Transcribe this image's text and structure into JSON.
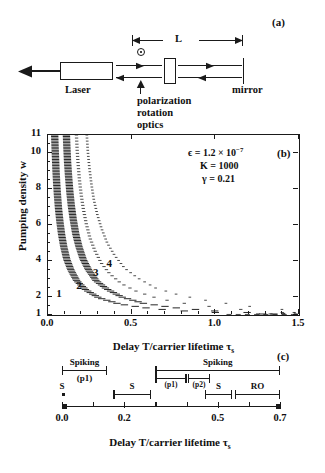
{
  "figure": {
    "panel_a": {
      "tag": "(a)",
      "cavity_length_label": "L",
      "laser_label": "Laser",
      "polarization_label_line1": "polarization",
      "polarization_label_line2": "rotation",
      "polarization_label_line3": "optics",
      "mirror_label": "mirror",
      "polarization_symbol": "circle-dot",
      "output_arrow": "left-arrow"
    },
    "panel_b": {
      "tag": "(b)",
      "params": {
        "epsilon_label": "ϵ = 1.2 × 10",
        "epsilon_exp": "−7",
        "K_label": "K = 1000",
        "gamma_label": "γ = 0.21"
      },
      "curve_labels": [
        "1",
        "2",
        "3",
        "4"
      ]
    },
    "panel_c": {
      "tag": "(c)",
      "brackets": [
        {
          "name": "spiking-p1",
          "label_top": "Spiking",
          "label_bottom": "(p1)",
          "x0": 0.0,
          "x1": 0.145
        },
        {
          "name": "spiking-p1-p2",
          "label_top": "Spiking",
          "label_bottom": "",
          "x0": 0.3,
          "x1": 0.7
        },
        {
          "name": "p1-sub",
          "label_top": "",
          "label_bottom": "(p1)",
          "x0": 0.3,
          "x1": 0.4
        },
        {
          "name": "p2-sub",
          "label_top": "",
          "label_bottom": "(p2)",
          "x0": 0.405,
          "x1": 0.475
        },
        {
          "name": "s-left",
          "label_top": "S",
          "label_bottom": "",
          "x0": 0.0,
          "x1": 0.0
        },
        {
          "name": "s-mid",
          "label_top": "S",
          "label_bottom": "",
          "x0": 0.165,
          "x1": 0.285
        },
        {
          "name": "s-right",
          "label_top": "S",
          "label_bottom": "",
          "x0": 0.46,
          "x1": 0.545
        },
        {
          "name": "ro",
          "label_top": "RO",
          "label_bottom": "",
          "x0": 0.555,
          "x1": 0.7
        }
      ]
    },
    "shared": {
      "xlabel": "Delay T/carrier lifetime τ",
      "xlabel_sub": "s",
      "ylabel_b": "Pumping density w"
    }
  },
  "chart_data": [
    {
      "id": "panel-b",
      "type": "line",
      "title": "",
      "xlabel": "Delay T/carrier lifetime τs",
      "ylabel": "Pumping density w",
      "xlim": [
        0.0,
        1.5
      ],
      "ylim": [
        1,
        11
      ],
      "xticks": [
        0.0,
        0.5,
        1.0,
        1.5
      ],
      "xticklabels": [
        "0.0",
        "0.5",
        "1.0",
        "1.5"
      ],
      "yticks": [
        1,
        2,
        4,
        6,
        8,
        10,
        11
      ],
      "yticklabels": [
        "1",
        "2",
        "4",
        "6",
        "8",
        "10",
        "11"
      ],
      "grid": false,
      "legend": "none",
      "annotations": [
        {
          "text": "ϵ = 1.2 × 10−7",
          "x": 0.78,
          "y": 10.3
        },
        {
          "text": "K = 1000",
          "x": 0.8,
          "y": 9.3
        },
        {
          "text": "γ = 0.21",
          "x": 0.8,
          "y": 8.4
        },
        {
          "text": "(b)",
          "x": 1.37,
          "y": 10.3
        }
      ],
      "series": [
        {
          "name": "1",
          "label_pos": {
            "x": 0.055,
            "y": 2.1
          },
          "style": "dense-dashed-band",
          "band_halfwidth": 0.022,
          "x": [
            0.04,
            0.042,
            0.045,
            0.048,
            0.052,
            0.057,
            0.063,
            0.071,
            0.081,
            0.094,
            0.112,
            0.137,
            0.172,
            0.225,
            0.305,
            0.43,
            0.62,
            0.9,
            1.3
          ],
          "y": [
            11.0,
            10.4,
            9.7,
            9.0,
            8.3,
            7.6,
            6.9,
            6.2,
            5.5,
            4.8,
            4.1,
            3.5,
            2.9,
            2.4,
            1.95,
            1.6,
            1.35,
            1.17,
            1.05
          ]
        },
        {
          "name": "2",
          "label_pos": {
            "x": 0.175,
            "y": 2.55
          },
          "style": "dense-dashed-band",
          "band_halfwidth": 0.022,
          "x": [
            0.11,
            0.113,
            0.117,
            0.123,
            0.13,
            0.139,
            0.151,
            0.166,
            0.185,
            0.21,
            0.243,
            0.288,
            0.35,
            0.44,
            0.57,
            0.76,
            1.03,
            1.35
          ],
          "y": [
            11.0,
            10.3,
            9.5,
            8.7,
            7.9,
            7.1,
            6.3,
            5.5,
            4.8,
            4.1,
            3.5,
            2.9,
            2.45,
            2.0,
            1.65,
            1.4,
            1.2,
            1.08
          ]
        },
        {
          "name": "3",
          "label_pos": {
            "x": 0.275,
            "y": 3.3
          },
          "style": "dotted",
          "band_halfwidth": 0.01,
          "x": [
            0.17,
            0.174,
            0.18,
            0.188,
            0.198,
            0.211,
            0.228,
            0.25,
            0.279,
            0.317,
            0.368,
            0.437,
            0.532,
            0.663,
            0.845,
            1.09,
            1.4
          ],
          "y": [
            11.0,
            10.2,
            9.4,
            8.5,
            7.7,
            6.9,
            6.1,
            5.3,
            4.6,
            3.9,
            3.3,
            2.75,
            2.3,
            1.9,
            1.6,
            1.35,
            1.15
          ]
        },
        {
          "name": "4",
          "label_pos": {
            "x": 0.355,
            "y": 3.8
          },
          "style": "dotted-sparse",
          "band_halfwidth": 0.008,
          "x": [
            0.232,
            0.238,
            0.247,
            0.259,
            0.274,
            0.294,
            0.32,
            0.354,
            0.399,
            0.458,
            0.537,
            0.643,
            0.787,
            0.98,
            1.23,
            1.47
          ],
          "y": [
            11.0,
            10.1,
            9.2,
            8.3,
            7.4,
            6.6,
            5.8,
            5.0,
            4.3,
            3.6,
            3.05,
            2.5,
            2.1,
            1.75,
            1.45,
            1.25
          ]
        }
      ]
    },
    {
      "id": "panel-c",
      "type": "annotation-axis",
      "xlabel": "Delay T/carrier lifetime τs",
      "xlim": [
        0.0,
        0.7
      ],
      "xticks": [
        0.0,
        0.1,
        0.2,
        0.3,
        0.4,
        0.5,
        0.6,
        0.7
      ],
      "xticklabels": [
        "0.0",
        "",
        "0.2",
        "",
        "",
        "0.5",
        "",
        "0.7"
      ],
      "regions": [
        {
          "label": "Spiking (p1)",
          "start": 0.0,
          "end": 0.145,
          "row": 0
        },
        {
          "label": "Spiking",
          "start": 0.3,
          "end": 0.7,
          "row": 0
        },
        {
          "label": "(p1)",
          "start": 0.3,
          "end": 0.4,
          "row": 1
        },
        {
          "label": "(p2)",
          "start": 0.405,
          "end": 0.475,
          "row": 1
        },
        {
          "label": "S",
          "start": 0.0,
          "end": 0.0,
          "row": 2
        },
        {
          "label": "S",
          "start": 0.165,
          "end": 0.285,
          "row": 2
        },
        {
          "label": "S",
          "start": 0.46,
          "end": 0.545,
          "row": 2
        },
        {
          "label": "RO",
          "start": 0.555,
          "end": 0.7,
          "row": 2
        }
      ]
    }
  ]
}
